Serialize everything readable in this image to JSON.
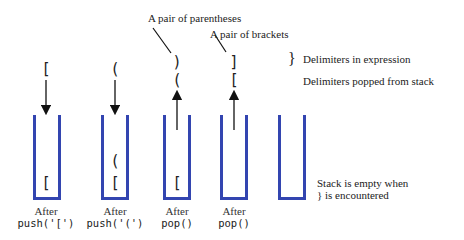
{
  "annotations": {
    "parentheses_pair": "A pair of parentheses",
    "brackets_pair": "A pair of brackets",
    "expression_brace": "}",
    "expression_label": "Delimiters in expression",
    "popped_label": "Delimiters popped from stack",
    "empty_line1": "Stack is empty when",
    "empty_line2": "} is encountered"
  },
  "steps": [
    {
      "label_top": "After",
      "label_op": "push('[')",
      "incoming": "[",
      "arrow": "down",
      "contents": [
        "["
      ]
    },
    {
      "label_top": "After",
      "label_op": "push('(')",
      "incoming": "(",
      "arrow": "down",
      "contents": [
        "(",
        "["
      ]
    },
    {
      "label_top": "After",
      "label_op": "pop()",
      "expression": ")",
      "popped": "(",
      "arrow": "up",
      "contents": [
        "["
      ]
    },
    {
      "label_top": "After",
      "label_op": "pop()",
      "expression": "]",
      "popped": "[",
      "arrow": "up",
      "contents": []
    },
    {
      "label_top": "",
      "label_op": "",
      "contents": []
    }
  ],
  "colors": {
    "stack": "#3345b0",
    "text": "#222222"
  }
}
